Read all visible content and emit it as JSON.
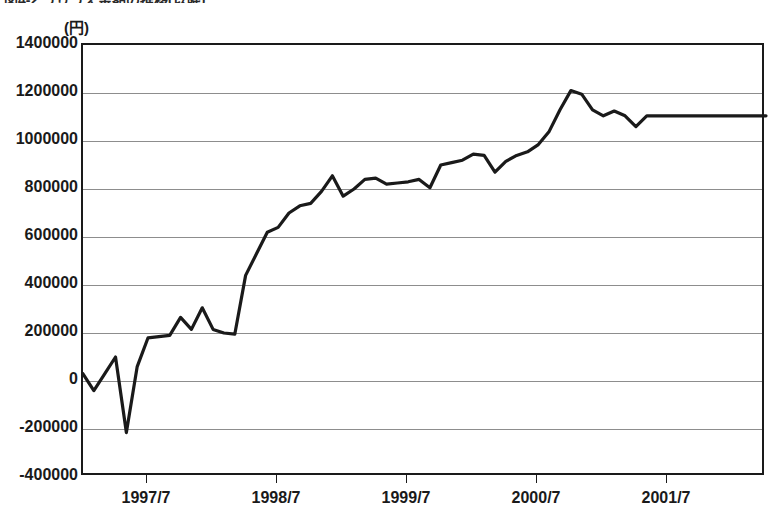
{
  "caption": "図4-2 うりうえ金額の推移(以降)",
  "axis": {
    "unit_label": "(円)",
    "y_ticks": [
      "1400000",
      "1200000",
      "1000000",
      "800000",
      "600000",
      "400000",
      "200000",
      "0",
      "-200000",
      "-400000"
    ],
    "x_ticks": [
      "1997/7",
      "1998/7",
      "1999/7",
      "2000/7",
      "2001/7"
    ]
  },
  "chart_data": {
    "type": "line",
    "title": "図4-2 うりうえ金額の推移(以降)",
    "xlabel": "",
    "ylabel": "(円)",
    "ylim": [
      -400000,
      1400000
    ],
    "ytick_step": 200000,
    "grid": true,
    "legend": "none",
    "line_color": "#1a1a1a",
    "x_tick_labels": [
      "1997/7",
      "1998/7",
      "1999/7",
      "2000/7",
      "2001/7"
    ],
    "x_tick_index": [
      6,
      18,
      30,
      42,
      54
    ],
    "x_range_index": [
      0,
      63
    ],
    "x": [
      "1997/1",
      "1997/2",
      "1997/3",
      "1997/4",
      "1997/5",
      "1997/6",
      "1997/7",
      "1997/8",
      "1997/9",
      "1997/10",
      "1997/11",
      "1997/12",
      "1998/1",
      "1998/2",
      "1998/3",
      "1998/4",
      "1998/5",
      "1998/6",
      "1998/7",
      "1998/8",
      "1998/9",
      "1998/10",
      "1998/11",
      "1998/12",
      "1999/1",
      "1999/2",
      "1999/3",
      "1999/4",
      "1999/5",
      "1999/6",
      "1999/7",
      "1999/8",
      "1999/9",
      "1999/10",
      "1999/11",
      "1999/12",
      "2000/1",
      "2000/2",
      "2000/3",
      "2000/4",
      "2000/5",
      "2000/6",
      "2000/7",
      "2000/8",
      "2000/9",
      "2000/10",
      "2000/11",
      "2000/12",
      "2001/1",
      "2001/2",
      "2001/3",
      "2001/4",
      "2001/5",
      "2001/6",
      "2001/7",
      "2001/8",
      "2001/9",
      "2001/10",
      "2001/11",
      "2001/12",
      "2002/1",
      "2002/2",
      "2002/3",
      "2002/4"
    ],
    "values": [
      30000,
      -40000,
      30000,
      100000,
      -215000,
      60000,
      180000,
      185000,
      190000,
      265000,
      215000,
      305000,
      215000,
      200000,
      195000,
      440000,
      530000,
      620000,
      640000,
      700000,
      730000,
      740000,
      790000,
      855000,
      770000,
      800000,
      840000,
      845000,
      820000,
      825000,
      830000,
      840000,
      805000,
      900000,
      910000,
      920000,
      945000,
      940000,
      870000,
      915000,
      940000,
      955000,
      985000,
      1040000,
      1130000,
      1210000,
      1195000,
      1130000,
      1105000,
      1125000,
      1105000,
      1060000,
      1105000,
      1105000,
      1105000,
      1105000,
      1105000,
      1105000,
      1105000,
      1105000,
      1105000,
      1105000,
      1105000,
      1105000
    ]
  }
}
